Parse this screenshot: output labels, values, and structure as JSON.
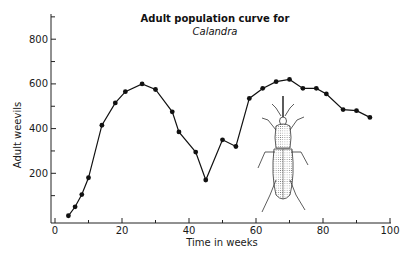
{
  "chart_data": {
    "type": "line",
    "title": "Adult population curve for",
    "subtitle": "Calandra",
    "xlabel": "Time in weeks",
    "ylabel": "Adult weevils",
    "xlim": [
      0,
      100
    ],
    "ylim": [
      0,
      900
    ],
    "x_ticks": [
      0,
      20,
      40,
      60,
      80,
      100
    ],
    "x_minor_ticks": [
      10,
      30,
      50,
      70,
      90
    ],
    "y_ticks": [
      200,
      400,
      600,
      800
    ],
    "y_minor_ticks": [
      100,
      300,
      500,
      700,
      900
    ],
    "grid": false,
    "legend": null,
    "annotation": "Illustration of a grain weevil (Calandra) drawn inside the plot area below the second peak",
    "series": [
      {
        "name": "Adult weevils",
        "marker": "filled-circle",
        "color": "#111111",
        "x": [
          4,
          6,
          8,
          10,
          14,
          18,
          21,
          26,
          30,
          35,
          37,
          42,
          45,
          50,
          54,
          58,
          62,
          66,
          70,
          74,
          78,
          81,
          86,
          90,
          94
        ],
        "y": [
          10,
          50,
          105,
          180,
          415,
          515,
          565,
          600,
          575,
          475,
          385,
          295,
          170,
          350,
          320,
          535,
          580,
          610,
          620,
          580,
          580,
          555,
          485,
          480,
          450
        ]
      }
    ]
  }
}
